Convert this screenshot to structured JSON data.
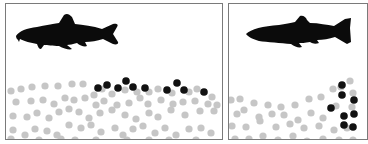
{
  "figure": {
    "panels": [
      {
        "id": "panel-1",
        "fish": "minnow-silhouette",
        "pebble_color": "#c6c6c6",
        "egg_color": "#111111",
        "description": "eggs scattered on top of gravel surface",
        "grey_pebbles": [
          [
            10,
            90
          ],
          [
            20,
            88
          ],
          [
            31,
            86
          ],
          [
            44,
            85
          ],
          [
            57,
            85
          ],
          [
            71,
            83
          ],
          [
            82,
            83
          ],
          [
            93,
            94
          ],
          [
            101,
            88
          ],
          [
            111,
            93
          ],
          [
            124,
            89
          ],
          [
            136,
            91
          ],
          [
            148,
            91
          ],
          [
            157,
            88
          ],
          [
            171,
            92
          ],
          [
            188,
            91
          ],
          [
            196,
            88
          ],
          [
            211,
            96
          ],
          [
            15,
            101
          ],
          [
            30,
            100
          ],
          [
            42,
            99
          ],
          [
            53,
            103
          ],
          [
            64,
            97
          ],
          [
            73,
            99
          ],
          [
            84,
            97
          ],
          [
            95,
            104
          ],
          [
            103,
            100
          ],
          [
            116,
            104
          ],
          [
            128,
            102
          ],
          [
            139,
            97
          ],
          [
            147,
            103
          ],
          [
            160,
            99
          ],
          [
            172,
            103
          ],
          [
            182,
            101
          ],
          [
            194,
            100
          ],
          [
            207,
            103
          ],
          [
            216,
            104
          ],
          [
            12,
            115
          ],
          [
            26,
            116
          ],
          [
            36,
            112
          ],
          [
            48,
            117
          ],
          [
            58,
            111
          ],
          [
            68,
            108
          ],
          [
            78,
            111
          ],
          [
            88,
            117
          ],
          [
            99,
            112
          ],
          [
            111,
            109
          ],
          [
            124,
            114
          ],
          [
            135,
            118
          ],
          [
            148,
            112
          ],
          [
            157,
            116
          ],
          [
            170,
            109
          ],
          [
            184,
            114
          ],
          [
            199,
            110
          ],
          [
            213,
            110
          ],
          [
            12,
            129
          ],
          [
            24,
            134
          ],
          [
            34,
            128
          ],
          [
            46,
            130
          ],
          [
            56,
            134
          ],
          [
            68,
            124
          ],
          [
            80,
            127
          ],
          [
            90,
            124
          ],
          [
            100,
            131
          ],
          [
            114,
            127
          ],
          [
            122,
            134
          ],
          [
            132,
            128
          ],
          [
            142,
            125
          ],
          [
            154,
            132
          ],
          [
            164,
            127
          ],
          [
            175,
            134
          ],
          [
            188,
            128
          ],
          [
            200,
            127
          ],
          [
            210,
            132
          ],
          [
            10,
            138
          ],
          [
            38,
            139
          ],
          [
            60,
            138
          ],
          [
            74,
            139
          ],
          [
            95,
            139
          ],
          [
            126,
            139
          ],
          [
            148,
            139
          ],
          [
            168,
            139
          ],
          [
            195,
            139
          ]
        ],
        "black_eggs": [
          [
            97,
            87
          ],
          [
            106,
            84
          ],
          [
            117,
            87
          ],
          [
            125,
            80
          ],
          [
            132,
            86
          ],
          [
            144,
            87
          ],
          [
            166,
            89
          ],
          [
            176,
            82
          ],
          [
            183,
            89
          ],
          [
            203,
            91
          ]
        ]
      },
      {
        "id": "panel-2",
        "fish": "trout-silhouette",
        "pebble_color": "#c6c6c6",
        "egg_color": "#111111",
        "description": "eggs buried in a pocket within the gravel",
        "grey_pebbles": [
          [
            230,
            99
          ],
          [
            239,
            98
          ],
          [
            253,
            102
          ],
          [
            267,
            104
          ],
          [
            280,
            106
          ],
          [
            294,
            104
          ],
          [
            308,
            98
          ],
          [
            320,
            96
          ],
          [
            332,
            88
          ],
          [
            340,
            86
          ],
          [
            349,
            80
          ],
          [
            352,
            92
          ],
          [
            236,
            113
          ],
          [
            243,
            109
          ],
          [
            258,
            116
          ],
          [
            271,
            113
          ],
          [
            283,
            114
          ],
          [
            297,
            119
          ],
          [
            310,
            112
          ],
          [
            322,
            117
          ],
          [
            335,
            105
          ],
          [
            351,
            106
          ],
          [
            231,
            125
          ],
          [
            245,
            126
          ],
          [
            259,
            120
          ],
          [
            275,
            126
          ],
          [
            289,
            123
          ],
          [
            303,
            127
          ],
          [
            318,
            125
          ],
          [
            333,
            129
          ],
          [
            346,
            127
          ],
          [
            234,
            138
          ],
          [
            248,
            138
          ],
          [
            262,
            135
          ],
          [
            277,
            139
          ],
          [
            292,
            135
          ],
          [
            306,
            140
          ],
          [
            322,
            138
          ],
          [
            338,
            139
          ],
          [
            352,
            139
          ]
        ],
        "black_eggs": [
          [
            330,
            107
          ],
          [
            341,
            94
          ],
          [
            353,
            99
          ],
          [
            343,
            115
          ],
          [
            353,
            113
          ],
          [
            343,
            124
          ],
          [
            352,
            126
          ],
          [
            341,
            84
          ]
        ]
      }
    ]
  }
}
